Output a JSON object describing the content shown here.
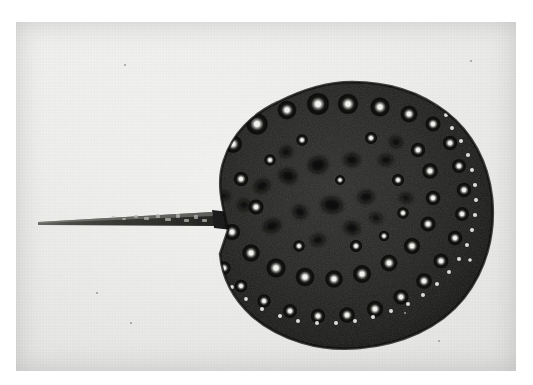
{
  "image": {
    "kind": "photograph",
    "medium": "black-and-white halftone print",
    "subject": "freshwater stingray specimen, dorsal view",
    "orientation": "tail pointing left, disc to the right",
    "caption_text": "",
    "overlay_text": ""
  },
  "canvas": {
    "width": 533,
    "height": 385,
    "page_background": "#ffffff"
  },
  "photo_plate": {
    "x": 16,
    "y": 22,
    "width": 500,
    "height": 349,
    "paper_tone": "#ebebe9",
    "paper_tone_light": "#f3f3f1",
    "paper_tone_dark": "#e1e1df"
  },
  "specimen": {
    "name": "stingray",
    "disc": {
      "center_x": 318,
      "center_y": 205,
      "radius_x": 148,
      "radius_y": 133,
      "body_dark": "#1d1d1d",
      "body_mid": "#2b2b2b",
      "rim_dark": "#141414",
      "outline_note": "near-circular disc with slightly scalloped upper-left margin and a notch at the tail base"
    },
    "tail": {
      "tip_x": 38,
      "tip_y": 216,
      "base_x": 212,
      "base_y": 212,
      "length_px": 174,
      "max_thickness_px": 13,
      "tone": "#2a2a28",
      "texture": "mottled light scale markings on the thicker proximal half"
    },
    "markings": {
      "ocelli_label": "pale-centred dark ring spots (ocelli)",
      "ocelli_center_color": "#f2f2f0",
      "ocelli_ring_color": "#0d0d0d",
      "blotch_label": "irregular dark blotches on the central disc",
      "blotch_color": "#0e0e0e",
      "margin_dots_label": "small pale tubercles along the disc margin",
      "ocelli_count": 58,
      "blotch_count": 17,
      "margin_dot_count": 46
    }
  },
  "ocelli": [
    {
      "x": 340,
      "y": 72,
      "r": 6.0
    },
    {
      "x": 367,
      "y": 74,
      "r": 5.4
    },
    {
      "x": 392,
      "y": 80,
      "r": 5.0
    },
    {
      "x": 415,
      "y": 88,
      "r": 4.6
    },
    {
      "x": 306,
      "y": 78,
      "r": 5.2
    },
    {
      "x": 281,
      "y": 86,
      "r": 4.4
    },
    {
      "x": 257,
      "y": 96,
      "r": 4.2
    },
    {
      "x": 237,
      "y": 110,
      "r": 4.6
    },
    {
      "x": 221,
      "y": 128,
      "r": 4.4
    },
    {
      "x": 211,
      "y": 149,
      "r": 4.6
    },
    {
      "x": 206,
      "y": 172,
      "r": 4.2
    },
    {
      "x": 318,
      "y": 104,
      "r": 7.6
    },
    {
      "x": 348,
      "y": 104,
      "r": 7.0
    },
    {
      "x": 380,
      "y": 107,
      "r": 6.6
    },
    {
      "x": 409,
      "y": 114,
      "r": 5.8
    },
    {
      "x": 433,
      "y": 124,
      "r": 5.2
    },
    {
      "x": 287,
      "y": 110,
      "r": 6.4
    },
    {
      "x": 257,
      "y": 124,
      "r": 7.4
    },
    {
      "x": 233,
      "y": 144,
      "r": 6.2
    },
    {
      "x": 450,
      "y": 143,
      "r": 5.0
    },
    {
      "x": 459,
      "y": 166,
      "r": 4.8
    },
    {
      "x": 464,
      "y": 190,
      "r": 5.0
    },
    {
      "x": 462,
      "y": 214,
      "r": 4.8
    },
    {
      "x": 455,
      "y": 238,
      "r": 5.0
    },
    {
      "x": 441,
      "y": 261,
      "r": 5.2
    },
    {
      "x": 424,
      "y": 281,
      "r": 5.4
    },
    {
      "x": 401,
      "y": 297,
      "r": 5.2
    },
    {
      "x": 375,
      "y": 309,
      "r": 5.6
    },
    {
      "x": 347,
      "y": 315,
      "r": 5.4
    },
    {
      "x": 318,
      "y": 316,
      "r": 5.0
    },
    {
      "x": 290,
      "y": 311,
      "r": 4.8
    },
    {
      "x": 264,
      "y": 301,
      "r": 4.6
    },
    {
      "x": 241,
      "y": 286,
      "r": 4.4
    },
    {
      "x": 224,
      "y": 268,
      "r": 4.6
    },
    {
      "x": 213,
      "y": 247,
      "r": 4.8
    },
    {
      "x": 241,
      "y": 179,
      "r": 5.0
    },
    {
      "x": 232,
      "y": 232,
      "r": 5.6
    },
    {
      "x": 251,
      "y": 253,
      "r": 6.0
    },
    {
      "x": 276,
      "y": 268,
      "r": 6.6
    },
    {
      "x": 305,
      "y": 277,
      "r": 6.4
    },
    {
      "x": 334,
      "y": 279,
      "r": 6.0
    },
    {
      "x": 362,
      "y": 274,
      "r": 6.2
    },
    {
      "x": 389,
      "y": 263,
      "r": 5.8
    },
    {
      "x": 412,
      "y": 246,
      "r": 5.6
    },
    {
      "x": 428,
      "y": 224,
      "r": 5.2
    },
    {
      "x": 433,
      "y": 198,
      "r": 5.0
    },
    {
      "x": 430,
      "y": 171,
      "r": 5.4
    },
    {
      "x": 418,
      "y": 150,
      "r": 5.0
    },
    {
      "x": 256,
      "y": 207,
      "r": 5.2
    },
    {
      "x": 398,
      "y": 180,
      "r": 4.2
    },
    {
      "x": 403,
      "y": 213,
      "r": 4.0
    },
    {
      "x": 356,
      "y": 246,
      "r": 4.2
    },
    {
      "x": 299,
      "y": 246,
      "r": 4.0
    },
    {
      "x": 270,
      "y": 160,
      "r": 4.0
    },
    {
      "x": 302,
      "y": 140,
      "r": 4.0
    },
    {
      "x": 371,
      "y": 138,
      "r": 4.2
    },
    {
      "x": 340,
      "y": 180,
      "r": 3.4
    },
    {
      "x": 384,
      "y": 236,
      "r": 3.6
    }
  ],
  "blotches": [
    {
      "x": 318,
      "y": 165,
      "rx": 11,
      "ry": 9,
      "rot": -12
    },
    {
      "x": 288,
      "y": 176,
      "rx": 10,
      "ry": 8,
      "rot": 18
    },
    {
      "x": 352,
      "y": 160,
      "rx": 9,
      "ry": 7,
      "rot": 5
    },
    {
      "x": 262,
      "y": 186,
      "rx": 9,
      "ry": 7,
      "rot": -25
    },
    {
      "x": 332,
      "y": 205,
      "rx": 12,
      "ry": 9,
      "rot": 8
    },
    {
      "x": 366,
      "y": 197,
      "rx": 9,
      "ry": 7,
      "rot": -8
    },
    {
      "x": 300,
      "y": 212,
      "rx": 8,
      "ry": 7,
      "rot": 30
    },
    {
      "x": 272,
      "y": 226,
      "rx": 10,
      "ry": 7,
      "rot": -18
    },
    {
      "x": 352,
      "y": 228,
      "rx": 9,
      "ry": 7,
      "rot": 12
    },
    {
      "x": 386,
      "y": 160,
      "rx": 8,
      "ry": 6,
      "rot": -5
    },
    {
      "x": 396,
      "y": 142,
      "rx": 7,
      "ry": 6,
      "rot": 20
    },
    {
      "x": 244,
      "y": 205,
      "rx": 7,
      "ry": 6,
      "rot": 0
    },
    {
      "x": 318,
      "y": 240,
      "rx": 8,
      "ry": 6,
      "rot": -14
    },
    {
      "x": 406,
      "y": 198,
      "rx": 7,
      "ry": 5,
      "rot": 10
    },
    {
      "x": 286,
      "y": 152,
      "rx": 7,
      "ry": 6,
      "rot": -22
    },
    {
      "x": 224,
      "y": 196,
      "rx": 6,
      "ry": 5,
      "rot": 0
    },
    {
      "x": 376,
      "y": 218,
      "rx": 7,
      "ry": 5,
      "rot": 16
    }
  ],
  "margin_dots": [
    {
      "x": 452,
      "y": 128,
      "r": 2.0
    },
    {
      "x": 461,
      "y": 141,
      "r": 2.0
    },
    {
      "x": 468,
      "y": 155,
      "r": 2.1
    },
    {
      "x": 472,
      "y": 170,
      "r": 2.0
    },
    {
      "x": 475,
      "y": 185,
      "r": 2.1
    },
    {
      "x": 476,
      "y": 200,
      "r": 2.0
    },
    {
      "x": 475,
      "y": 215,
      "r": 2.1
    },
    {
      "x": 472,
      "y": 230,
      "r": 2.0
    },
    {
      "x": 467,
      "y": 245,
      "r": 2.0
    },
    {
      "x": 459,
      "y": 259,
      "r": 2.0
    },
    {
      "x": 449,
      "y": 272,
      "r": 2.0
    },
    {
      "x": 437,
      "y": 284,
      "r": 2.0
    },
    {
      "x": 423,
      "y": 295,
      "r": 2.0
    },
    {
      "x": 408,
      "y": 304,
      "r": 2.0
    },
    {
      "x": 391,
      "y": 311,
      "r": 2.0
    },
    {
      "x": 373,
      "y": 317,
      "r": 2.0
    },
    {
      "x": 355,
      "y": 321,
      "r": 2.0
    },
    {
      "x": 336,
      "y": 323,
      "r": 2.0
    },
    {
      "x": 317,
      "y": 323,
      "r": 2.0
    },
    {
      "x": 298,
      "y": 321,
      "r": 2.0
    },
    {
      "x": 280,
      "y": 316,
      "r": 2.0
    },
    {
      "x": 262,
      "y": 309,
      "r": 2.0
    },
    {
      "x": 246,
      "y": 299,
      "r": 1.9
    },
    {
      "x": 232,
      "y": 287,
      "r": 1.9
    },
    {
      "x": 220,
      "y": 273,
      "r": 1.9
    },
    {
      "x": 211,
      "y": 258,
      "r": 1.9
    },
    {
      "x": 205,
      "y": 242,
      "r": 1.9
    },
    {
      "x": 202,
      "y": 170,
      "r": 1.9
    },
    {
      "x": 205,
      "y": 154,
      "r": 1.9
    },
    {
      "x": 211,
      "y": 138,
      "r": 1.9
    },
    {
      "x": 220,
      "y": 123,
      "r": 1.9
    },
    {
      "x": 232,
      "y": 109,
      "r": 1.9
    },
    {
      "x": 246,
      "y": 97,
      "r": 1.9
    },
    {
      "x": 262,
      "y": 87,
      "r": 1.9
    },
    {
      "x": 279,
      "y": 79,
      "r": 1.9
    },
    {
      "x": 297,
      "y": 73,
      "r": 1.9
    },
    {
      "x": 315,
      "y": 69,
      "r": 2.0
    },
    {
      "x": 334,
      "y": 68,
      "r": 2.0
    },
    {
      "x": 353,
      "y": 69,
      "r": 2.0
    },
    {
      "x": 372,
      "y": 72,
      "r": 2.0
    },
    {
      "x": 390,
      "y": 77,
      "r": 2.0
    },
    {
      "x": 407,
      "y": 84,
      "r": 2.0
    },
    {
      "x": 423,
      "y": 93,
      "r": 2.0
    },
    {
      "x": 437,
      "y": 104,
      "r": 2.0
    },
    {
      "x": 446,
      "y": 115,
      "r": 2.0
    },
    {
      "x": 470,
      "y": 260,
      "r": 1.8
    }
  ],
  "paper_specks": [
    {
      "x": 404,
      "y": 312,
      "size": 2
    },
    {
      "x": 96,
      "y": 292,
      "size": 2
    },
    {
      "x": 130,
      "y": 322,
      "size": 2
    },
    {
      "x": 438,
      "y": 340,
      "size": 2
    },
    {
      "x": 124,
      "y": 64,
      "size": 2
    },
    {
      "x": 470,
      "y": 60,
      "size": 2
    }
  ]
}
